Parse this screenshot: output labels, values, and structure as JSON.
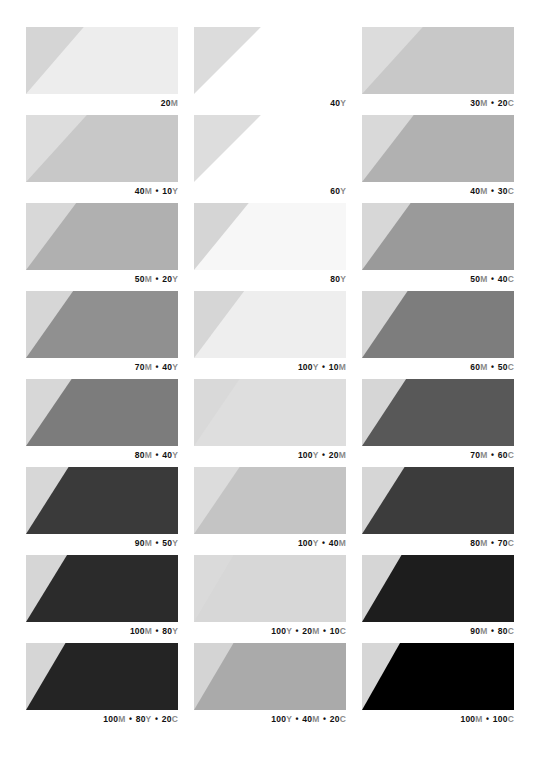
{
  "document": {
    "title": "Process Color Swatch Chart",
    "background": "#ffffff",
    "columns": 3,
    "rows": 8,
    "label_separator": "•"
  },
  "chart_data": {
    "type": "table",
    "xlabel": "",
    "ylabel": "",
    "columns": [
      "Magenta + Yellow builds",
      "Yellow builds",
      "Magenta + Cyan builds"
    ],
    "swatches": [
      {
        "row": 1,
        "col": 1,
        "label": "20M",
        "inks": [
          {
            "pct": 20,
            "ink": "M"
          }
        ],
        "base": "#ededed",
        "tint": "#d5d5d5",
        "diagonal_x_pct": 38
      },
      {
        "row": 1,
        "col": 2,
        "label": "40Y",
        "inks": [
          {
            "pct": 40,
            "ink": "Y"
          }
        ],
        "base": "#ffffff",
        "tint": "#dcdcdc",
        "diagonal_x_pct": 44
      },
      {
        "row": 1,
        "col": 3,
        "label": "30M • 20C",
        "inks": [
          {
            "pct": 30,
            "ink": "M"
          },
          {
            "pct": 20,
            "ink": "C"
          }
        ],
        "base": "#c8c8c8",
        "tint": "#dcdcdc",
        "diagonal_x_pct": 40
      },
      {
        "row": 2,
        "col": 1,
        "label": "40M • 10Y",
        "inks": [
          {
            "pct": 40,
            "ink": "M"
          },
          {
            "pct": 10,
            "ink": "Y"
          }
        ],
        "base": "#c8c8c8",
        "tint": "#dddddd",
        "diagonal_x_pct": 40
      },
      {
        "row": 2,
        "col": 2,
        "label": "60Y",
        "inks": [
          {
            "pct": 60,
            "ink": "Y"
          }
        ],
        "base": "#ffffff",
        "tint": "#dddddd",
        "diagonal_x_pct": 44
      },
      {
        "row": 2,
        "col": 3,
        "label": "40M • 30C",
        "inks": [
          {
            "pct": 40,
            "ink": "M"
          },
          {
            "pct": 30,
            "ink": "C"
          }
        ],
        "base": "#b1b1b1",
        "tint": "#d9d9d9",
        "diagonal_x_pct": 34
      },
      {
        "row": 3,
        "col": 1,
        "label": "50M • 20Y",
        "inks": [
          {
            "pct": 50,
            "ink": "M"
          },
          {
            "pct": 20,
            "ink": "Y"
          }
        ],
        "base": "#b0b0b0",
        "tint": "#d8d8d8",
        "diagonal_x_pct": 33
      },
      {
        "row": 3,
        "col": 2,
        "label": "80Y",
        "inks": [
          {
            "pct": 80,
            "ink": "Y"
          }
        ],
        "base": "#f7f7f7",
        "tint": "#d5d5d5",
        "diagonal_x_pct": 36
      },
      {
        "row": 3,
        "col": 3,
        "label": "50M • 40C",
        "inks": [
          {
            "pct": 50,
            "ink": "M"
          },
          {
            "pct": 40,
            "ink": "C"
          }
        ],
        "base": "#9a9a9a",
        "tint": "#d7d7d7",
        "diagonal_x_pct": 32
      },
      {
        "row": 4,
        "col": 1,
        "label": "70M • 40Y",
        "inks": [
          {
            "pct": 70,
            "ink": "M"
          },
          {
            "pct": 40,
            "ink": "Y"
          }
        ],
        "base": "#909090",
        "tint": "#d6d6d6",
        "diagonal_x_pct": 31
      },
      {
        "row": 4,
        "col": 2,
        "label": "100Y • 10M",
        "inks": [
          {
            "pct": 100,
            "ink": "Y"
          },
          {
            "pct": 10,
            "ink": "M"
          }
        ],
        "base": "#eeeeee",
        "tint": "#d6d6d6",
        "diagonal_x_pct": 33
      },
      {
        "row": 4,
        "col": 3,
        "label": "60M • 50C",
        "inks": [
          {
            "pct": 60,
            "ink": "M"
          },
          {
            "pct": 50,
            "ink": "C"
          }
        ],
        "base": "#7d7d7d",
        "tint": "#d6d6d6",
        "diagonal_x_pct": 30
      },
      {
        "row": 5,
        "col": 1,
        "label": "80M • 40Y",
        "inks": [
          {
            "pct": 80,
            "ink": "M"
          },
          {
            "pct": 40,
            "ink": "Y"
          }
        ],
        "base": "#7c7c7c",
        "tint": "#d7d7d7",
        "diagonal_x_pct": 30
      },
      {
        "row": 5,
        "col": 2,
        "label": "100Y • 20M",
        "inks": [
          {
            "pct": 100,
            "ink": "Y"
          },
          {
            "pct": 20,
            "ink": "M"
          }
        ],
        "base": "#dedede",
        "tint": "#d9d9d9",
        "diagonal_x_pct": 30
      },
      {
        "row": 5,
        "col": 3,
        "label": "70M • 60C",
        "inks": [
          {
            "pct": 70,
            "ink": "M"
          },
          {
            "pct": 60,
            "ink": "C"
          }
        ],
        "base": "#585858",
        "tint": "#d6d6d6",
        "diagonal_x_pct": 29
      },
      {
        "row": 6,
        "col": 1,
        "label": "90M • 50Y",
        "inks": [
          {
            "pct": 90,
            "ink": "M"
          },
          {
            "pct": 50,
            "ink": "Y"
          }
        ],
        "base": "#3a3a3a",
        "tint": "#d7d7d7",
        "diagonal_x_pct": 28
      },
      {
        "row": 6,
        "col": 2,
        "label": "100Y • 40M",
        "inks": [
          {
            "pct": 100,
            "ink": "Y"
          },
          {
            "pct": 40,
            "ink": "M"
          }
        ],
        "base": "#c4c4c4",
        "tint": "#dcdcdc",
        "diagonal_x_pct": 30
      },
      {
        "row": 6,
        "col": 3,
        "label": "80M • 70C",
        "inks": [
          {
            "pct": 80,
            "ink": "M"
          },
          {
            "pct": 70,
            "ink": "C"
          }
        ],
        "base": "#3c3c3c",
        "tint": "#d6d6d6",
        "diagonal_x_pct": 28
      },
      {
        "row": 7,
        "col": 1,
        "label": "100M • 80Y",
        "inks": [
          {
            "pct": 100,
            "ink": "M"
          },
          {
            "pct": 80,
            "ink": "Y"
          }
        ],
        "base": "#2b2b2b",
        "tint": "#d6d6d6",
        "diagonal_x_pct": 27
      },
      {
        "row": 7,
        "col": 2,
        "label": "100Y • 20M • 10C",
        "inks": [
          {
            "pct": 100,
            "ink": "Y"
          },
          {
            "pct": 20,
            "ink": "M"
          },
          {
            "pct": 10,
            "ink": "C"
          }
        ],
        "base": "#d7d7d7",
        "tint": "#dadada",
        "diagonal_x_pct": 26
      },
      {
        "row": 7,
        "col": 3,
        "label": "90M • 80C",
        "inks": [
          {
            "pct": 90,
            "ink": "M"
          },
          {
            "pct": 80,
            "ink": "C"
          }
        ],
        "base": "#1d1d1d",
        "tint": "#d6d6d6",
        "diagonal_x_pct": 26
      },
      {
        "row": 8,
        "col": 1,
        "label": "100M • 80Y • 20C",
        "inks": [
          {
            "pct": 100,
            "ink": "M"
          },
          {
            "pct": 80,
            "ink": "Y"
          },
          {
            "pct": 20,
            "ink": "C"
          }
        ],
        "base": "#242424",
        "tint": "#d6d6d6",
        "diagonal_x_pct": 26
      },
      {
        "row": 8,
        "col": 2,
        "label": "100Y • 40M • 20C",
        "inks": [
          {
            "pct": 100,
            "ink": "Y"
          },
          {
            "pct": 40,
            "ink": "M"
          },
          {
            "pct": 20,
            "ink": "C"
          }
        ],
        "base": "#aaaaaa",
        "tint": "#d4d4d4",
        "diagonal_x_pct": 26
      },
      {
        "row": 8,
        "col": 3,
        "label": "100M • 100C",
        "inks": [
          {
            "pct": 100,
            "ink": "M"
          },
          {
            "pct": 100,
            "ink": "C"
          }
        ],
        "base": "#000000",
        "tint": "#d6d6d6",
        "diagonal_x_pct": 25
      }
    ]
  }
}
